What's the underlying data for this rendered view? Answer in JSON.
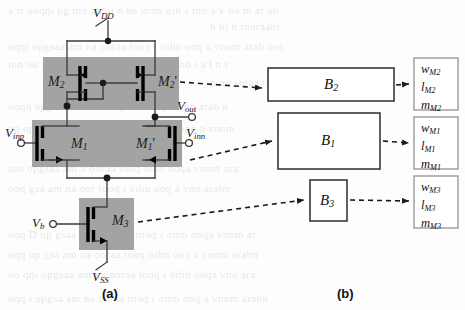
{
  "figure": {
    "caption_a": "(a)",
    "caption_b": "(b)"
  },
  "circuit": {
    "title": "CMOS differential amplifier schematic",
    "supplies": [
      {
        "name": "vdd-label",
        "base": "V",
        "sub": "DD"
      },
      {
        "name": "vss-label",
        "base": "V",
        "sub": "SS"
      }
    ],
    "nets": {
      "vdd": {
        "base": "V",
        "sub": "DD"
      },
      "vss": {
        "base": "V",
        "sub": "SS"
      },
      "vinp": {
        "base": "V",
        "sub": "inp"
      },
      "vinn": {
        "base": "V",
        "sub": "inn"
      },
      "vout": {
        "base": "V",
        "sub": "out"
      },
      "vb": {
        "base": "V",
        "sub": "b"
      }
    },
    "transistors": [
      {
        "id": "m2",
        "base": "M",
        "sub": "2",
        "prime": "",
        "type": "pmos",
        "group": "load-pair"
      },
      {
        "id": "m2p",
        "base": "M",
        "sub": "2",
        "prime": "'",
        "type": "pmos",
        "group": "load-pair"
      },
      {
        "id": "m1",
        "base": "M",
        "sub": "1",
        "prime": "",
        "type": "nmos",
        "group": "input-pair"
      },
      {
        "id": "m1p",
        "base": "M",
        "sub": "1",
        "prime": "'",
        "type": "nmos",
        "group": "input-pair"
      },
      {
        "id": "m3",
        "base": "M",
        "sub": "3",
        "prime": "",
        "type": "nmos",
        "group": "tail-source"
      }
    ],
    "shaded_groups": [
      {
        "name": "load-pair-region"
      },
      {
        "name": "input-pair-region"
      },
      {
        "name": "tail-source-region"
      }
    ]
  },
  "blocks": [
    {
      "id": "b2",
      "base": "B",
      "sub": "2"
    },
    {
      "id": "b1",
      "base": "B",
      "sub": "1"
    },
    {
      "id": "b3",
      "base": "B",
      "sub": "3"
    }
  ],
  "parameter_boxes": [
    {
      "id": "params-m2",
      "rows": [
        {
          "base": "w",
          "sub": "M2"
        },
        {
          "base": "l",
          "sub": "M2"
        },
        {
          "base": "m",
          "sub": "M2"
        }
      ]
    },
    {
      "id": "params-m1",
      "rows": [
        {
          "base": "w",
          "sub": "M1"
        },
        {
          "base": "l",
          "sub": "M1"
        },
        {
          "base": "m",
          "sub": "M1"
        }
      ]
    },
    {
      "id": "params-m3",
      "rows": [
        {
          "base": "w",
          "sub": "M3"
        },
        {
          "base": "l",
          "sub": "M3"
        },
        {
          "base": "m",
          "sub": "M3"
        }
      ]
    }
  ],
  "colors": {
    "shade": "#a3a3a3",
    "wire": "#3a3a3a",
    "device": "#000000",
    "box_stroke": "#2b2b2b",
    "param_box_stroke": "#9a9a9a",
    "background": "#fdfdfd"
  },
  "background_text": [
    "a   b   c   d   e   f  g   h   i   j   k   l",
    "m n o p q r s t u v w x y z",
    "the quick brown fox jumps over"
  ]
}
